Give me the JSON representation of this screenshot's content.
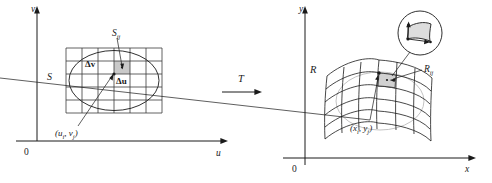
{
  "figure": {
    "type": "math-transformation-diagram",
    "transformation_label": "T"
  },
  "left_panel": {
    "name": "uv-plane",
    "axis_x_label": "u",
    "axis_y_label": "v",
    "origin_label": "0",
    "region_label": "S",
    "subrectangle_label": "S",
    "subrectangle_sub": "ij",
    "delta_v_label": "Δv",
    "delta_u_label": "Δu",
    "point_label": "(u",
    "point_sub_i": "i",
    "point_mid": ", v",
    "point_sub_j": "j",
    "point_close": ")",
    "grid": {
      "columns": 6,
      "rows": 5
    },
    "shaded_cell": {
      "col": 3,
      "row": 2
    }
  },
  "right_panel": {
    "name": "xy-plane",
    "axis_x_label": "x",
    "axis_y_label": "y",
    "origin_label": "0",
    "region_label": "R",
    "subregion_label": "R",
    "subregion_sub": "ij",
    "point_label": "(x",
    "point_sub_i": "i",
    "point_mid": ", y",
    "point_sub_j": "j",
    "point_close": ")",
    "inset": {
      "name": "magnified-subregion",
      "shape": "curvilinear-quadrilateral-with-tangent-vectors"
    }
  },
  "colors": {
    "ink": "#1a1a1a",
    "grid": "#3a3a3a",
    "shade": "#c9c9c9",
    "background": "#ffffff"
  }
}
